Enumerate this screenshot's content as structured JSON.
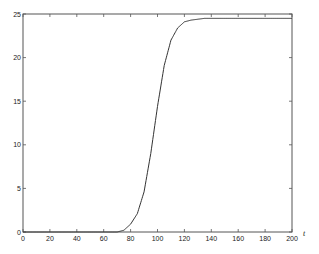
{
  "chart_data": {
    "type": "line",
    "title": "",
    "xlabel": "t",
    "ylabel": "",
    "xlim": [
      0,
      200
    ],
    "ylim": [
      0,
      25
    ],
    "grid": false,
    "legend": null,
    "xticks": [
      0,
      20,
      40,
      60,
      80,
      100,
      120,
      140,
      160,
      180,
      200
    ],
    "yticks": [
      0,
      5,
      10,
      15,
      20,
      25
    ],
    "series": [
      {
        "name": "curve",
        "color": "#333333",
        "x": [
          0,
          10,
          20,
          30,
          40,
          50,
          60,
          70,
          75,
          80,
          85,
          90,
          95,
          100,
          105,
          110,
          115,
          120,
          125,
          130,
          135,
          140,
          150,
          160,
          170,
          180,
          190,
          200
        ],
        "y": [
          0,
          0,
          0,
          0,
          0,
          0,
          0,
          0,
          0.2,
          0.9,
          2.1,
          4.6,
          9.0,
          14.4,
          19.1,
          22.0,
          23.4,
          24.1,
          24.3,
          24.4,
          24.5,
          24.5,
          24.5,
          24.5,
          24.5,
          24.5,
          24.5,
          24.5
        ]
      }
    ]
  },
  "colors": {
    "axis": "#555555",
    "line": "#333333",
    "background": "#ffffff"
  }
}
